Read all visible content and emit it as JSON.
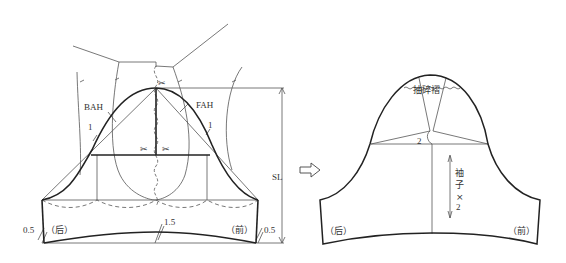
{
  "left_diagram": {
    "labels": {
      "bah": "BAH",
      "fah": "FAH",
      "sl": "SL",
      "back": "（后）",
      "front": "（前）",
      "ease_left": "0.5",
      "ease_right": "0.5",
      "hem_curve": "1.5",
      "offset_left": "1",
      "offset_right": "1"
    },
    "symbols": {
      "scissors_top": "✂",
      "scissors_left": "✂",
      "scissors_right": "✂"
    }
  },
  "arrow": {
    "icon": "hollow-right-arrow"
  },
  "right_diagram": {
    "labels": {
      "gather": "抽碎褶",
      "spread": "2",
      "back": "（后）",
      "front": "（前）",
      "sleeve_x2_line1": "袖",
      "sleeve_x2_line2": "子",
      "sleeve_x2_line3": "×",
      "sleeve_x2_line4": "2"
    }
  },
  "colors": {
    "line": "#222222",
    "thin_line": "#555555",
    "text": "#333333"
  }
}
